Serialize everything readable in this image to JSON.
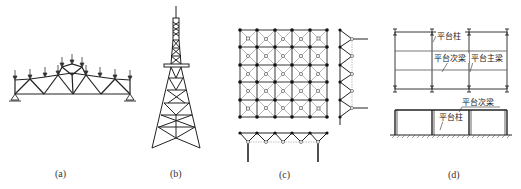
{
  "figure": {
    "panels": [
      {
        "id": "a",
        "caption": "(a)",
        "subject": "roof-truss"
      },
      {
        "id": "b",
        "caption": "(b)",
        "subject": "lattice-tower"
      },
      {
        "id": "c",
        "caption": "(c)",
        "subject": "space-grid-structure"
      },
      {
        "id": "d",
        "caption": "(d)",
        "subject": "steel-platform"
      }
    ],
    "labels_d": {
      "platform_column_top": "平台柱",
      "platform_secondary_beam_top": "平台次梁",
      "platform_main_beam": "平台主梁",
      "platform_secondary_beam_elev": "平台次梁",
      "platform_column_elev": "平台柱"
    },
    "colors": {
      "line": "#222222",
      "light_line": "#888888",
      "background": "#ffffff"
    }
  }
}
